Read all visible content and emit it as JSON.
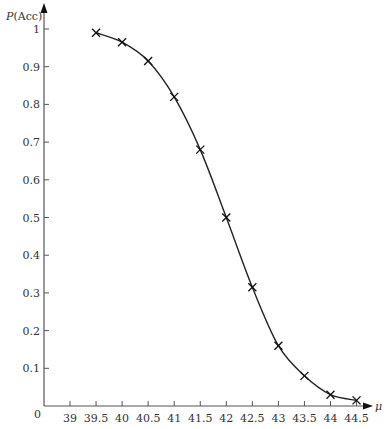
{
  "chart_data": {
    "type": "line",
    "title": "",
    "xlabel": "μ",
    "ylabel": "P(Acc)",
    "ylabel_parts": {
      "italic": "P",
      "rest": "(Acc)"
    },
    "origin_label": "0",
    "x_ticks": [
      39,
      39.5,
      40,
      40.5,
      41,
      41.5,
      42,
      42.5,
      43,
      43.5,
      44,
      44.5
    ],
    "x_tick_labels": [
      "39",
      "39.5",
      "40",
      "40.5",
      "41",
      "41.5",
      "42",
      "42.5",
      "43",
      "43.5",
      "44",
      "44.5"
    ],
    "y_ticks": [
      0.1,
      0.2,
      0.3,
      0.4,
      0.5,
      0.6,
      0.7,
      0.8,
      0.9,
      1
    ],
    "y_tick_labels": [
      "0.1",
      "0.2",
      "0.3",
      "0.4",
      "0.5",
      "0.6",
      "0.7",
      "0.8",
      "0.9",
      "1"
    ],
    "xlim": [
      38.5,
      45
    ],
    "ylim": [
      0,
      1.05
    ],
    "grid": false,
    "legend": null,
    "marker": "x",
    "series": [
      {
        "name": "P(Acc)",
        "x": [
          39.5,
          40,
          40.5,
          41,
          41.5,
          42,
          42.5,
          43,
          43.5,
          44,
          44.5
        ],
        "values": [
          0.99,
          0.965,
          0.915,
          0.82,
          0.68,
          0.5,
          0.315,
          0.16,
          0.08,
          0.03,
          0.015
        ]
      }
    ],
    "colors": {
      "line": "#222222",
      "axis": "#555555",
      "text": "#333333"
    }
  }
}
